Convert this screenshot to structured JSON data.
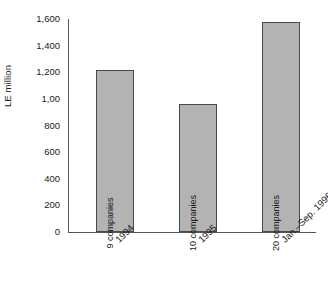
{
  "chart_data": {
    "type": "bar",
    "title": "",
    "subtitle": "",
    "xlabel": "",
    "ylabel": "LE million",
    "categories": [
      "1994",
      "1995",
      "Jan.–Sep. 1996"
    ],
    "values": [
      1217,
      960,
      1577
    ],
    "bar_labels": [
      "9 companies",
      "10 companies",
      "20 companies"
    ],
    "ylim": [
      0,
      1600
    ],
    "ytick_values": [
      0,
      200,
      400,
      600,
      800,
      1000,
      1200,
      1400,
      1600
    ],
    "ytick_labels": [
      "0",
      "200",
      "400",
      "600",
      "800",
      "1,00",
      "1,200",
      "1,400",
      "1,600"
    ],
    "grid": false,
    "legend": "none",
    "bar_color": "#b3b3b3",
    "bar_border_color": "#4a4a4a",
    "axis_color": "#555555",
    "text_color": "#1a1a1a",
    "background": "#ffffff"
  }
}
